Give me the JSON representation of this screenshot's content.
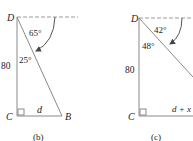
{
  "figures": [
    {
      "id": "b",
      "caption": "(b)",
      "vertices": {
        "top": "D",
        "bottom_left": "C",
        "bottom_right": "B"
      },
      "side_vertical": "80",
      "side_horizontal": "d",
      "angle_depression": "65°",
      "angle_at_D": "25°"
    },
    {
      "id": "c",
      "caption": "(c)",
      "vertices": {
        "top": "D",
        "bottom_left": "C"
      },
      "side_vertical": "80",
      "side_horizontal": "d + x",
      "angle_depression": "42°",
      "angle_at_D": "48°"
    }
  ],
  "colors": {
    "line": "#8a8a8a",
    "dash": "#9a9a9a",
    "text": "#222222"
  }
}
